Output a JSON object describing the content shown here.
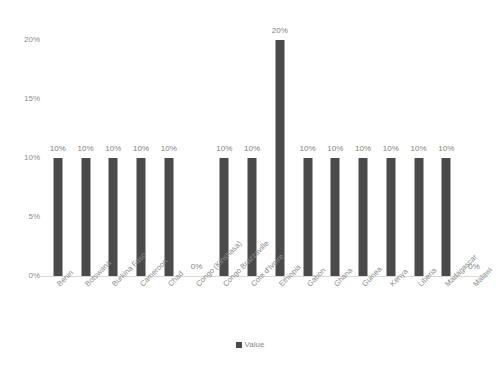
{
  "chart_data": {
    "type": "bar",
    "title": "",
    "subtitle": "",
    "xlabel": "",
    "ylabel": "",
    "ylim": [
      0,
      20
    ],
    "grid": false,
    "legend_position": "bottom",
    "value_suffix": "%",
    "series_name": "Value",
    "bar_color": "#4a4a4a",
    "axis_color": "#d9d9d9",
    "text_color": "#8c8c8c",
    "categories": [
      "Benin",
      "Botswana",
      "Burkina Faso",
      "Cameroon",
      "Chad",
      "Congo (Kinshasa)",
      "Congo Brazzaville",
      "Cote d'Ivoire",
      "Ethiopia",
      "Gabon",
      "Ghana",
      "Guinea",
      "Kenya",
      "Liberia",
      "Madagascar",
      "Malawi"
    ],
    "values": [
      10,
      10,
      10,
      10,
      10,
      0,
      10,
      10,
      20,
      10,
      10,
      10,
      10,
      10,
      10,
      0
    ],
    "data_labels": [
      "10%",
      "10%",
      "10%",
      "10%",
      "10%",
      "0%",
      "10%",
      "10%",
      "20%",
      "10%",
      "10%",
      "10%",
      "10%",
      "10%",
      "10%",
      "0%"
    ],
    "ytick_labels": [
      "0%",
      "5%",
      "10%",
      "15%",
      "20%"
    ],
    "ytick_values": [
      0,
      5,
      10,
      15,
      20
    ],
    "legend": [
      {
        "label": "Value",
        "color": "#4a4a4a"
      }
    ]
  }
}
